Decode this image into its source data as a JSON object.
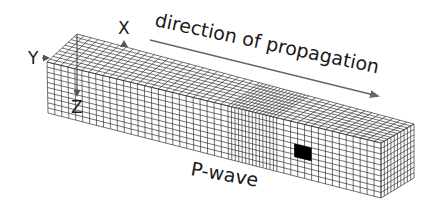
{
  "diagram": {
    "labels": {
      "x_axis": "X",
      "y_axis": "Y",
      "z_axis": "Z",
      "direction": "direction of propagation",
      "wave_type": "P-wave"
    },
    "grid": {
      "length_cells": 48,
      "height_cells": 10,
      "depth_cells": 10,
      "compression_zone_cell_range": [
        26,
        33
      ],
      "highlighted_cell": "black square on front face"
    },
    "colors": {
      "grid_line": "#333333",
      "highlight": "#000000",
      "arrow": "#666666",
      "text": "#1a1a1a",
      "background": "#ffffff"
    }
  }
}
